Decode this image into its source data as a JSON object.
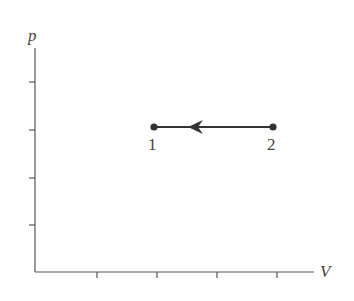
{
  "diagram": {
    "type": "p-V process diagram",
    "axes": {
      "x_label": "V",
      "y_label": "p",
      "x_ticks_count": 4,
      "y_ticks_count": 4
    },
    "states": [
      {
        "id": "state-1",
        "label": "1"
      },
      {
        "id": "state-2",
        "label": "2"
      }
    ],
    "process": {
      "from": "2",
      "to": "1",
      "kind": "isobaric compression",
      "direction": "leftward"
    },
    "colors": {
      "axis": "#555555",
      "process": "#333333",
      "text": "#444444",
      "background": "#ffffff"
    }
  }
}
